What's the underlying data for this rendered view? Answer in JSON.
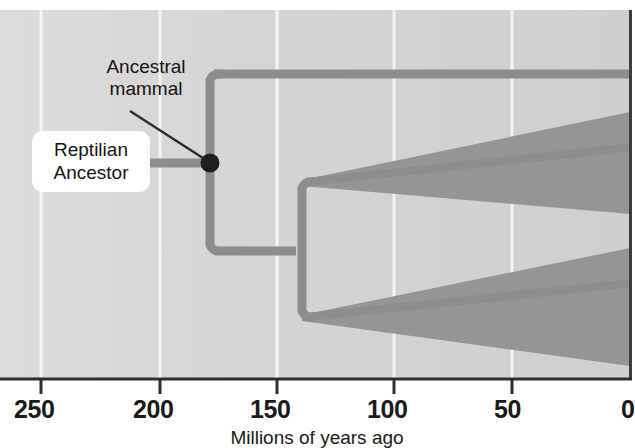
{
  "figure": {
    "type": "phylogenetic-tree-diagram",
    "axis": {
      "title": "Millions of years ago",
      "tick_labels": [
        "250",
        "200",
        "150",
        "100",
        "50",
        "0"
      ],
      "tick_values": [
        250,
        200,
        150,
        100,
        50,
        0
      ],
      "tick_x": [
        41,
        160,
        277,
        394,
        512,
        630
      ],
      "direction": "reversed",
      "unit": "Ma"
    },
    "labels": {
      "ancestral_mammal": "Ancestral\nmammal",
      "reptilian_ancestor": "Reptilian\nAncestor"
    },
    "nodes": [
      {
        "name": "ancestral-mammal-node",
        "label": "Ancestral mammal",
        "age_ma": 178,
        "x": 210,
        "y": 163,
        "radius": 9
      },
      {
        "name": "therian-split-node",
        "label": "",
        "age_ma": 140,
        "x": 302,
        "y": 251,
        "radius": 0
      }
    ],
    "branches": [
      {
        "name": "reptilian-stem",
        "from_x": 104,
        "to_x": 210,
        "y": 163
      },
      {
        "name": "monotreme-lineage",
        "from_x": 210,
        "to_x": 630,
        "y": 74
      },
      {
        "name": "therian-stem",
        "from_x": 210,
        "to_x": 302,
        "y": 251
      },
      {
        "name": "marsupial-lineage",
        "from_x": 302,
        "to_x": 630,
        "y": 182
      },
      {
        "name": "placental-lineage",
        "from_x": 302,
        "to_x": 630,
        "y": 317
      }
    ],
    "diversity_wedges": [
      {
        "name": "marsupial-diversity-wedge",
        "start_x": 302,
        "end_x": 630,
        "start_top_y": 180,
        "start_bottom_y": 186,
        "end_top_y": 118,
        "end_bottom_y": 212
      },
      {
        "name": "placental-diversity-wedge",
        "start_x": 302,
        "end_x": 630,
        "start_top_y": 315,
        "start_bottom_y": 321,
        "end_top_y": 253,
        "end_bottom_y": 362
      }
    ],
    "gridlines_x": [
      41,
      160,
      277,
      394,
      512
    ],
    "plot_area": {
      "x": 0,
      "y": 10,
      "width": 630,
      "height": 368
    },
    "colors": {
      "background": "#ffffff",
      "plot_background": "#d6d6d6",
      "gridline": "#f2f2f2",
      "branch": "#8c8c8c",
      "wedge_fill": "#949494",
      "node_fill": "#1e1e1e",
      "axis_line": "#3a3a3a",
      "label_box": "#ffffff",
      "text": "#141414",
      "leader_line": "#2a2a2a"
    }
  }
}
